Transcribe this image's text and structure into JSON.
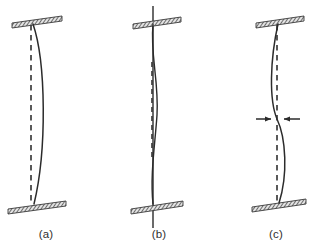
{
  "figure": {
    "background_color": "#ffffff",
    "line_color": "#2b2b2b",
    "hatch_color": "#3a3a3a",
    "plate_fill": "#d9d9d9",
    "dashed_color": "#3d3d3d",
    "panel_count": 3
  },
  "panels": [
    {
      "id": "a",
      "caption": "(a)",
      "caption_x": 46,
      "caption_y": 238,
      "description": "Fixed-fixed column buckled in single curvature bowing to the right",
      "axis_x": 33,
      "top_plate": {
        "name": "top-support-plate",
        "x": 12,
        "y": 18,
        "width": 50,
        "height": 5,
        "skew": 7,
        "hatched": true
      },
      "bottom_plate": {
        "name": "bottom-support-plate",
        "x": 8,
        "y": 203,
        "width": 58,
        "height": 5,
        "skew": 7,
        "hatched": true
      },
      "reference_line": {
        "name": "undeflected-axis",
        "style": "dashed",
        "x1": 31,
        "y1": 25,
        "x2": 31,
        "y2": 204
      },
      "deflected_curve": {
        "name": "deflected-shape",
        "style": "solid",
        "path": "M 33 24 C 46 62, 47 150, 34 204",
        "mode": "single-curvature",
        "max_offset_px": 13
      },
      "arrows": []
    },
    {
      "id": "b",
      "caption": "(b)",
      "caption_x": 159,
      "caption_y": 238,
      "description": "Braced column with small amplitude double-curvature deflection; restraint line extends beyond both supports",
      "axis_x": 153,
      "top_plate": {
        "name": "top-support-plate",
        "x": 133,
        "y": 19,
        "width": 48,
        "height": 5,
        "skew": 7,
        "hatched": true
      },
      "bottom_plate": {
        "name": "bottom-support-plate",
        "x": 131,
        "y": 203,
        "width": 52,
        "height": 5,
        "skew": 7,
        "hatched": true
      },
      "restraint_line": {
        "name": "restraint-axis-line",
        "style": "solid",
        "x1": 153,
        "y1": 6,
        "x2": 153,
        "y2": 228
      },
      "reference_line": {
        "name": "undeflected-axis",
        "style": "dashed",
        "x1": 152,
        "y1": 62,
        "x2": 152,
        "y2": 160
      },
      "deflected_curve": {
        "name": "deflected-shape",
        "style": "solid",
        "path": "M 153 24 C 150 55, 159 80, 157 115 C 155 145, 150 175, 153 204",
        "mode": "small-double-curvature",
        "max_offset_px": 5
      },
      "arrows": []
    },
    {
      "id": "c",
      "caption": "(c)",
      "caption_x": 276,
      "caption_y": 238,
      "description": "Column buckled in double curvature with inflection point marked by opposing arrows",
      "axis_x": 277,
      "top_plate": {
        "name": "top-support-plate",
        "x": 256,
        "y": 18,
        "width": 48,
        "height": 5,
        "skew": 7,
        "hatched": true
      },
      "bottom_plate": {
        "name": "bottom-support-plate",
        "x": 252,
        "y": 201,
        "width": 54,
        "height": 5,
        "skew": 7,
        "hatched": true
      },
      "reference_line": {
        "name": "undeflected-axis",
        "style": "dashed",
        "x1": 277,
        "y1": 25,
        "x2": 277,
        "y2": 203
      },
      "deflected_curve": {
        "name": "deflected-shape",
        "style": "solid",
        "path": "M 278 24 C 270 60, 269 100, 277 119 C 286 138, 288 175, 279 203",
        "mode": "double-curvature",
        "inflection_y": 119,
        "max_offset_px": 9
      },
      "arrows": [
        {
          "name": "inflection-arrow-left",
          "direction": "right",
          "x_start": 256,
          "x_end": 272,
          "y": 119
        },
        {
          "name": "inflection-arrow-right",
          "direction": "left",
          "x_start": 300,
          "x_end": 283,
          "y": 119
        }
      ]
    }
  ]
}
